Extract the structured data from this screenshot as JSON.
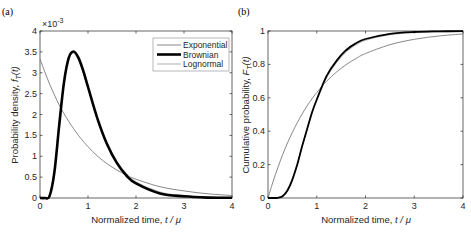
{
  "chart_data": [
    {
      "panel": "(a)",
      "type": "line",
      "xlabel": "Normalized time, t / μ",
      "ylabel": "Probability density, f_T(t)",
      "y_exponent_label": "×10⁻³",
      "xlim": [
        0,
        4
      ],
      "ylim": [
        0,
        4
      ],
      "xticks": [
        "0",
        "1",
        "2",
        "3",
        "4"
      ],
      "yticks": [
        "0",
        "0.5",
        "1",
        "1.5",
        "2",
        "2.5",
        "3",
        "3.5",
        "4"
      ],
      "grid": false,
      "legend_position": "upper right",
      "legend": [
        "Exponential",
        "Brownian",
        "Lognormal"
      ],
      "x": [
        0,
        0.1,
        0.2,
        0.3,
        0.4,
        0.5,
        0.6,
        0.7,
        0.8,
        0.9,
        1.0,
        1.2,
        1.4,
        1.6,
        1.8,
        2.0,
        2.5,
        3.0,
        3.5,
        4.0
      ],
      "series": [
        {
          "name": "Exponential",
          "color": "#7a7a7a",
          "width": 0.9,
          "values": [
            3.33,
            3.02,
            2.73,
            2.47,
            2.23,
            2.02,
            1.83,
            1.66,
            1.5,
            1.36,
            1.23,
            1.0,
            0.82,
            0.67,
            0.55,
            0.45,
            0.27,
            0.17,
            0.1,
            0.06
          ]
        },
        {
          "name": "Brownian",
          "color": "#000000",
          "width": 2.6,
          "values": [
            0,
            0,
            0.05,
            0.62,
            1.74,
            2.77,
            3.36,
            3.51,
            3.36,
            3.05,
            2.66,
            1.89,
            1.28,
            0.84,
            0.54,
            0.35,
            0.11,
            0.04,
            0.01,
            0.004
          ]
        },
        {
          "name": "Lognormal",
          "color": "#bdbdbd",
          "width": 1.2,
          "values": [
            0,
            0,
            0.06,
            0.68,
            1.8,
            2.8,
            3.35,
            3.47,
            3.31,
            3.01,
            2.64,
            1.9,
            1.31,
            0.88,
            0.58,
            0.38,
            0.14,
            0.05,
            0.02,
            0.01
          ]
        }
      ]
    },
    {
      "panel": "(b)",
      "type": "line",
      "xlabel": "Normalized time, t / μ",
      "ylabel": "Cumulative probability, F_T(t)",
      "xlim": [
        0,
        4
      ],
      "ylim": [
        0,
        1
      ],
      "xticks": [
        "0",
        "1",
        "2",
        "3",
        "4"
      ],
      "yticks": [
        "0",
        "0.2",
        "0.4",
        "0.6",
        "0.8",
        "1"
      ],
      "grid": false,
      "x": [
        0,
        0.1,
        0.2,
        0.3,
        0.4,
        0.5,
        0.6,
        0.7,
        0.8,
        0.9,
        1.0,
        1.2,
        1.4,
        1.6,
        1.8,
        2.0,
        2.5,
        3.0,
        3.5,
        4.0
      ],
      "series": [
        {
          "name": "Exponential",
          "color": "#7a7a7a",
          "width": 0.9,
          "values": [
            0,
            0.095,
            0.181,
            0.259,
            0.33,
            0.393,
            0.451,
            0.503,
            0.551,
            0.593,
            0.632,
            0.699,
            0.753,
            0.798,
            0.835,
            0.865,
            0.918,
            0.95,
            0.97,
            0.982
          ]
        },
        {
          "name": "Brownian",
          "color": "#000000",
          "width": 1.8,
          "values": [
            0,
            0,
            0.001,
            0.011,
            0.045,
            0.11,
            0.2,
            0.31,
            0.41,
            0.51,
            0.59,
            0.73,
            0.82,
            0.885,
            0.926,
            0.952,
            0.983,
            0.994,
            0.998,
            0.999
          ]
        },
        {
          "name": "Lognormal",
          "color": "#bdbdbd",
          "width": 1.2,
          "values": [
            0,
            0,
            0.002,
            0.013,
            0.05,
            0.115,
            0.205,
            0.31,
            0.41,
            0.505,
            0.585,
            0.72,
            0.81,
            0.875,
            0.918,
            0.945,
            0.978,
            0.991,
            0.996,
            0.998
          ]
        }
      ]
    }
  ],
  "labels": {
    "panel_a": "(a)",
    "panel_b": "(b)",
    "exponent_a": "×10",
    "exponent_power": "-3",
    "xlabel_a": "Normalized time, ",
    "xlabel_b": "Normalized time, ",
    "xlabel_var": "t / μ",
    "ylabel_a": "Probability density, ",
    "ylabel_b": "Cumulative probability, ",
    "ylabel_var": "F",
    "ylabel_var_a": "f",
    "ylabel_sub": "T",
    "ylabel_arg": "(t)"
  },
  "legend": {
    "items": [
      "Exponential",
      "Brownian",
      "Lognormal"
    ]
  }
}
